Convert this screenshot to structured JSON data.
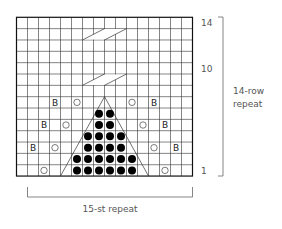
{
  "chart": {
    "columns": 16,
    "rows": 14,
    "row_labels": [
      {
        "row": 14,
        "text": "14"
      },
      {
        "row": 10,
        "text": "10"
      },
      {
        "row": 1,
        "text": "1"
      }
    ],
    "row_repeat_label": [
      "14-row",
      "repeat"
    ],
    "stitch_repeat_label": "15-st repeat",
    "stitch_repeat_columns": [
      2,
      16
    ],
    "symbols": {
      "B": [
        [
          7,
          4
        ],
        [
          7,
          13
        ],
        [
          5,
          3
        ],
        [
          5,
          14
        ],
        [
          3,
          2
        ],
        [
          3,
          15
        ]
      ],
      "yo_circle": [
        [
          7,
          6
        ],
        [
          7,
          11
        ],
        [
          5,
          5
        ],
        [
          5,
          12
        ],
        [
          3,
          4
        ],
        [
          3,
          13
        ],
        [
          1,
          3
        ],
        [
          1,
          14
        ]
      ],
      "dot": [
        [
          1,
          6
        ],
        [
          1,
          7
        ],
        [
          1,
          8
        ],
        [
          1,
          9
        ],
        [
          1,
          10
        ],
        [
          1,
          11
        ],
        [
          2,
          6
        ],
        [
          2,
          7
        ],
        [
          2,
          8
        ],
        [
          2,
          9
        ],
        [
          2,
          10
        ],
        [
          2,
          11
        ],
        [
          3,
          7
        ],
        [
          3,
          8
        ],
        [
          3,
          9
        ],
        [
          3,
          10
        ],
        [
          4,
          7
        ],
        [
          4,
          8
        ],
        [
          4,
          9
        ],
        [
          4,
          10
        ],
        [
          5,
          8
        ],
        [
          5,
          9
        ],
        [
          6,
          8
        ],
        [
          6,
          9
        ]
      ]
    },
    "triangle": {
      "base_left_col": 5,
      "base_right_col": 12,
      "base_row": 1,
      "peak_row": 7
    },
    "cables": [
      {
        "row": 13,
        "start_col": 7,
        "span_cols": 4
      },
      {
        "row": 9,
        "start_col": 7,
        "span_cols": 4
      }
    ],
    "colors": {
      "grid": "#333333",
      "fill": "#000000",
      "text": "#555555",
      "bracket": "#666666"
    }
  }
}
